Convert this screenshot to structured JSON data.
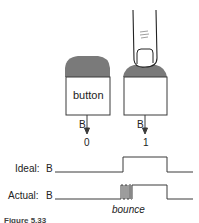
{
  "figure": {
    "button_label": "button",
    "left_output": {
      "signal": "B",
      "value": "0"
    },
    "right_output": {
      "signal": "B",
      "value": "1"
    },
    "colors": {
      "button_top": "#7a7a7a",
      "line": "#3a3a3a",
      "background": "#ffffff"
    }
  },
  "waveforms": {
    "ideal": {
      "label": "Ideal:",
      "signal": "B"
    },
    "actual": {
      "label": "Actual:",
      "signal": "B"
    },
    "annotation": "bounce"
  },
  "caption": "Figure 5.33"
}
